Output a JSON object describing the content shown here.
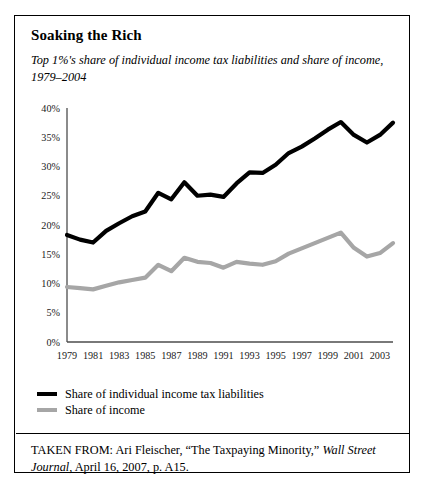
{
  "figure": {
    "title": "Soaking the Rich",
    "subtitle": "Top 1%'s share of individual income tax liabilities and share of income, 1979–2004"
  },
  "legend": {
    "items": [
      {
        "label": "Share of individual income tax liabilities",
        "color": "#000000"
      },
      {
        "label": "Share of income",
        "color": "#a6a6a6"
      }
    ]
  },
  "source": {
    "prefix": "TAKEN FROM: Ari Fleischer, “The Taxpaying Minority,” ",
    "publication": "Wall Street Journal",
    "suffix": ", April 16, 2007, p. A15."
  },
  "chart_data": {
    "type": "line",
    "title": "Soaking the Rich",
    "subtitle": "Top 1%'s share of individual income tax liabilities and share of income, 1979–2004",
    "xlabel": "",
    "ylabel": "",
    "x": [
      1979,
      1980,
      1981,
      1982,
      1983,
      1984,
      1985,
      1986,
      1987,
      1988,
      1989,
      1990,
      1991,
      1992,
      1993,
      1994,
      1995,
      1996,
      1997,
      1998,
      1999,
      2000,
      2001,
      2002,
      2003,
      2004
    ],
    "xlim": [
      1979,
      2004
    ],
    "ylim": [
      0,
      40
    ],
    "yticks": [
      0,
      5,
      10,
      15,
      20,
      25,
      30,
      35,
      40
    ],
    "ytick_labels": [
      "0%",
      "5%",
      "10%",
      "15%",
      "20%",
      "25%",
      "30%",
      "35%",
      "40%"
    ],
    "xtick_labels": [
      "1979",
      "1981",
      "1983",
      "1985",
      "1987",
      "1989",
      "1991",
      "1993",
      "1995",
      "1997",
      "1999",
      "2001",
      "2003"
    ],
    "grid": false,
    "legend_position": "below",
    "series": [
      {
        "name": "Share of individual income tax liabilities",
        "color": "#000000",
        "values": [
          18.3,
          17.5,
          17.0,
          19.0,
          20.3,
          21.5,
          22.3,
          25.5,
          24.4,
          27.3,
          25.0,
          25.2,
          24.8,
          27.1,
          29.0,
          28.9,
          30.3,
          32.3,
          33.4,
          34.8,
          36.3,
          37.6,
          35.4,
          34.1,
          35.4,
          37.5
        ]
      },
      {
        "name": "Share of income",
        "color": "#a6a6a6",
        "values": [
          9.4,
          9.2,
          9.0,
          9.6,
          10.2,
          10.6,
          11.0,
          13.2,
          12.1,
          14.4,
          13.7,
          13.5,
          12.7,
          13.7,
          13.4,
          13.2,
          13.8,
          15.1,
          16.0,
          16.9,
          17.8,
          18.7,
          16.1,
          14.6,
          15.2,
          16.9
        ]
      }
    ]
  }
}
